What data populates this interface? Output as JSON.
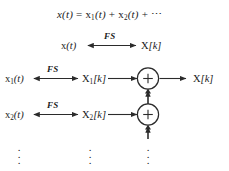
{
  "figure": {
    "title_equation": {
      "x_of_t": "x(t)",
      "equals": "=",
      "term1": "x",
      "term1_sub": "1",
      "term1_arg": "(t)",
      "plus1": "+",
      "term2": "x",
      "term2_sub": "2",
      "term2_arg": "(t)",
      "plus2": "+",
      "ellipsis": "⋯",
      "full_text": "x(t) = x1(t) + x2(t) + ⋯"
    },
    "transform_label": "FS",
    "rows": [
      {
        "id": "aggregate",
        "time_label": "x",
        "time_sub": "",
        "time_arg": "(t)",
        "freq_label": "X",
        "freq_sub": "",
        "freq_arg": "[k]",
        "transform": "FS"
      },
      {
        "id": "component-1",
        "time_label": "x",
        "time_sub": "1",
        "time_arg": "(t)",
        "freq_label": "X",
        "freq_sub": "1",
        "freq_arg": "[k]",
        "transform": "FS"
      },
      {
        "id": "component-2",
        "time_label": "x",
        "time_sub": "2",
        "time_arg": "(t)",
        "freq_label": "X",
        "freq_sub": "2",
        "freq_arg": "[k]",
        "transform": "FS"
      }
    ],
    "summing_junctions": [
      {
        "id": "adder-1",
        "symbol": "+"
      },
      {
        "id": "adder-2",
        "symbol": "+"
      }
    ],
    "output_label": "X",
    "output_arg": "[k]",
    "vertical_ellipsis": "⋮",
    "colors": {
      "background": "#ffffff",
      "ink": "#1a1a1a",
      "line": "#4a4a4a"
    }
  }
}
